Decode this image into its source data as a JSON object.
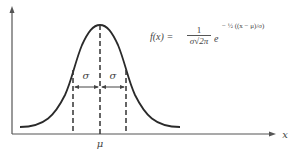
{
  "diagram": {
    "formula": {
      "lhs": "f(x) =",
      "coef_numerator": "1",
      "coef_denominator": "σ√2π",
      "base": "e",
      "exponent": "− ½ ((x − μ)/σ)"
    },
    "labels": {
      "sigma_left": "σ",
      "sigma_right": "σ",
      "mean": "μ",
      "x_axis": "x"
    },
    "colors": {
      "curve": "#2a2a2a",
      "axes": "#555555",
      "text": "#444444"
    }
  }
}
